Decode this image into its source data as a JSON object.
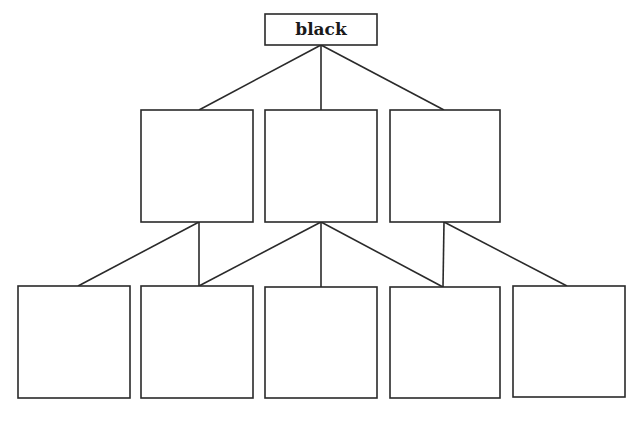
{
  "diagram": {
    "type": "tree",
    "root": {
      "id": "root",
      "label": "black"
    },
    "level1": [
      {
        "id": "m1",
        "label": ""
      },
      {
        "id": "m2",
        "label": ""
      },
      {
        "id": "m3",
        "label": ""
      }
    ],
    "level2": [
      {
        "id": "b1",
        "label": ""
      },
      {
        "id": "b2",
        "label": ""
      },
      {
        "id": "b3",
        "label": ""
      },
      {
        "id": "b4",
        "label": ""
      },
      {
        "id": "b5",
        "label": ""
      }
    ],
    "edges": [
      [
        "root",
        "m1"
      ],
      [
        "root",
        "m2"
      ],
      [
        "root",
        "m3"
      ],
      [
        "m1",
        "b1"
      ],
      [
        "m1",
        "b2"
      ],
      [
        "m2",
        "b2"
      ],
      [
        "m2",
        "b3"
      ],
      [
        "m2",
        "b4"
      ],
      [
        "m3",
        "b4"
      ],
      [
        "m3",
        "b5"
      ]
    ],
    "stroke_color": "#2a2a2a"
  }
}
